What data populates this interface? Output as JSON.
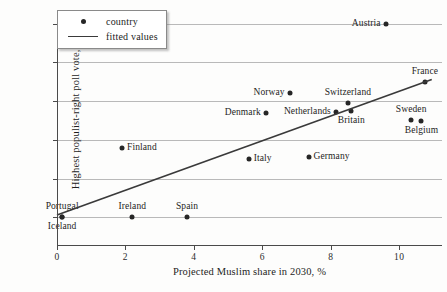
{
  "chart_data": {
    "type": "scatter",
    "title": "",
    "xlabel": "Projected Muslim share in 2030, %",
    "ylabel": "Highest populist-right poll vote, %",
    "xlim": [
      0,
      11.25
    ],
    "ylim": [
      -3,
      53
    ],
    "xticks": [
      0,
      2,
      4,
      6,
      8,
      10
    ],
    "xtick_labels": [
      "0",
      "2",
      "4",
      "6",
      "8",
      "10"
    ],
    "yticks": [
      0,
      10,
      20,
      30,
      40,
      50
    ],
    "ytick_labels": [
      "0",
      "10",
      "20",
      "30",
      "40",
      "50"
    ],
    "grid": "horizontal",
    "legend_position": "top-left",
    "legend": [
      {
        "label": "country",
        "marker": "dot"
      },
      {
        "label": "fitted values",
        "marker": "line"
      }
    ],
    "points": [
      {
        "name": "Iceland",
        "x": 0.15,
        "y": 0.0,
        "label_pos": "below"
      },
      {
        "name": "Portugal",
        "x": 0.15,
        "y": 0.0,
        "label_pos": "above"
      },
      {
        "name": "Ireland",
        "x": 2.2,
        "y": 0.0,
        "label_pos": "above"
      },
      {
        "name": "Spain",
        "x": 3.8,
        "y": 0.0,
        "label_pos": "above"
      },
      {
        "name": "Finland",
        "x": 1.9,
        "y": 18.0,
        "label_pos": "right"
      },
      {
        "name": "Italy",
        "x": 5.6,
        "y": 15.0,
        "label_pos": "right"
      },
      {
        "name": "Germany",
        "x": 7.35,
        "y": 15.5,
        "label_pos": "right"
      },
      {
        "name": "Denmark",
        "x": 6.1,
        "y": 27.0,
        "label_pos": "left"
      },
      {
        "name": "Norway",
        "x": 6.8,
        "y": 32.0,
        "label_pos": "left"
      },
      {
        "name": "Netherlands",
        "x": 8.15,
        "y": 27.3,
        "label_pos": "left"
      },
      {
        "name": "Switzerland",
        "x": 8.5,
        "y": 29.6,
        "label_pos": "above"
      },
      {
        "name": "Britain",
        "x": 8.6,
        "y": 27.5,
        "label_pos": "below"
      },
      {
        "name": "Sweden",
        "x": 10.35,
        "y": 25.2,
        "label_pos": "above"
      },
      {
        "name": "Belgium",
        "x": 10.65,
        "y": 25.0,
        "label_pos": "below"
      },
      {
        "name": "Austria",
        "x": 9.6,
        "y": 50.0,
        "label_pos": "left"
      },
      {
        "name": "France",
        "x": 10.75,
        "y": 35.0,
        "label_pos": "above"
      }
    ],
    "fitted_line": {
      "x0": 0.0,
      "y0": 0.6,
      "x1": 10.95,
      "y1": 35.6
    }
  }
}
